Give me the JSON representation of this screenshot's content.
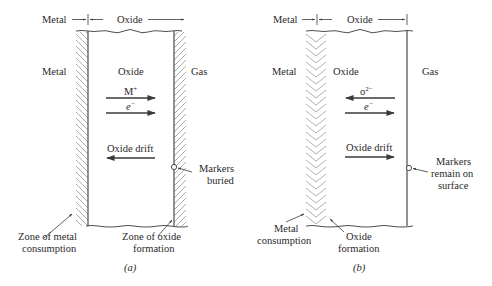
{
  "panels": [
    {
      "id": "a",
      "caption": "(a)",
      "header": {
        "metal": "Metal",
        "oxide": "Oxide"
      },
      "regions": {
        "metal": "Metal",
        "oxide": "Oxide",
        "gas": "Gas"
      },
      "flux": [
        {
          "species": "M",
          "charge": "+",
          "direction": "right"
        },
        {
          "species": "e",
          "charge": "−",
          "direction": "right"
        }
      ],
      "drift": {
        "label": "Oxide drift",
        "direction": "left"
      },
      "markers": {
        "line1": "Markers",
        "line2": "buried"
      },
      "zone_left": {
        "line1": "Zone of metal",
        "line2": "consumption"
      },
      "zone_right": {
        "line1": "Zone of oxide",
        "line2": "formation"
      }
    },
    {
      "id": "b",
      "caption": "(b)",
      "header": {
        "metal": "Metal",
        "oxide": "Oxide"
      },
      "regions": {
        "metal": "Metal",
        "oxide": "Oxide",
        "gas": "Gas"
      },
      "flux": [
        {
          "species": "o",
          "charge": "2−",
          "direction": "left"
        },
        {
          "species": "e",
          "charge": "−",
          "direction": "right"
        }
      ],
      "drift": {
        "label": "Oxide drift",
        "direction": "right"
      },
      "markers": {
        "line1": "Markers",
        "line2": "remain on",
        "line3": "surface"
      },
      "zone_left": {
        "line1": "Metal",
        "line2": "consumption"
      },
      "zone_right": {
        "line1": "Oxide",
        "line2": "formation"
      }
    }
  ],
  "colors": {
    "line": "#4a4a4a",
    "hatch": "#9a9a9a",
    "text": "#2a2a2a",
    "background": "#ffffff"
  }
}
